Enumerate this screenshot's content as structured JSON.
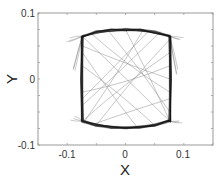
{
  "chart_data": {
    "type": "line",
    "title": "",
    "xlabel": "X",
    "ylabel": "Y",
    "xlim": [
      -0.15,
      0.15
    ],
    "ylim": [
      -0.1,
      0.1
    ],
    "xticks": [
      -0.1,
      0,
      0.1
    ],
    "yticks": [
      -0.1,
      0,
      0.1
    ],
    "xtick_labels": [
      "-0.1",
      "0",
      "0.1"
    ],
    "ytick_labels": [
      "-0.1",
      "0",
      "0.1"
    ],
    "grid": false,
    "legend": null,
    "series": [
      {
        "name": "loop-boundary",
        "color": "#111111",
        "x": [
          -0.074,
          -0.05,
          -0.025,
          0,
          0.025,
          0.05,
          0.076,
          0.077,
          0.076,
          0.074,
          0.05,
          0.025,
          0,
          -0.025,
          -0.05,
          -0.074,
          -0.075,
          -0.074
        ],
        "y": [
          0.065,
          0.071,
          0.074,
          0.075,
          0.074,
          0.071,
          0.065,
          0.0,
          -0.064,
          -0.064,
          -0.07,
          -0.073,
          -0.074,
          -0.073,
          -0.07,
          -0.064,
          0.0,
          0.065
        ]
      },
      {
        "name": "interior-chords",
        "color": "#888888",
        "segments": [
          [
            [
              -0.074,
              0.065
            ],
            [
              0.076,
              -0.064
            ]
          ],
          [
            [
              -0.06,
              0.07
            ],
            [
              0.076,
              -0.02
            ]
          ],
          [
            [
              -0.074,
              -0.04
            ],
            [
              0.06,
              0.072
            ]
          ],
          [
            [
              -0.074,
              -0.064
            ],
            [
              0.076,
              0.04
            ]
          ],
          [
            [
              -0.03,
              0.074
            ],
            [
              0.076,
              -0.05
            ]
          ],
          [
            [
              -0.074,
              0.02
            ],
            [
              0.05,
              -0.07
            ]
          ],
          [
            [
              -0.074,
              -0.02
            ],
            [
              0.076,
              0.02
            ]
          ],
          [
            [
              -0.05,
              -0.07
            ],
            [
              0.076,
              0.06
            ]
          ],
          [
            [
              -0.074,
              0.04
            ],
            [
              0.02,
              -0.073
            ]
          ],
          [
            [
              0.0,
              0.075
            ],
            [
              0.076,
              -0.064
            ]
          ],
          [
            [
              -0.07,
              -0.064
            ],
            [
              0.03,
              0.074
            ]
          ],
          [
            [
              -0.074,
              0.05
            ],
            [
              0.076,
              0.0
            ]
          ],
          [
            [
              -0.06,
              -0.07
            ],
            [
              0.076,
              -0.03
            ]
          ],
          [
            [
              0.04,
              0.073
            ],
            [
              -0.074,
              -0.03
            ]
          ]
        ]
      },
      {
        "name": "corner-overshoots",
        "color": "#666666",
        "points": [
          [
            -0.1,
            0.058
          ],
          [
            0.095,
            0.062
          ],
          [
            -0.09,
            -0.06
          ],
          [
            0.093,
            -0.062
          ],
          [
            0.088,
            0.01
          ],
          [
            -0.088,
            0.015
          ]
        ]
      }
    ]
  }
}
